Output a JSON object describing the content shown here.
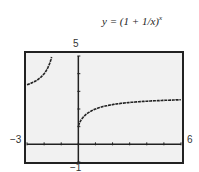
{
  "chart_data": {
    "type": "line",
    "xlabel": "",
    "ylabel": "",
    "xlim": [
      -3,
      6
    ],
    "ylim": [
      -1,
      5
    ],
    "window_labels": {
      "xmin": "−3",
      "xmax": "6",
      "ymin": "−1",
      "ymax": "5"
    },
    "x_tick_step": 1,
    "y_tick_step": 1,
    "grid": false,
    "series": [
      {
        "name": "left branch (x < -1)",
        "x": [
          -3,
          -2.5,
          -2,
          -1.5,
          -1.2,
          -1.1
        ],
        "values": [
          3.375,
          3.62,
          4.0,
          5.196,
          8.0,
          13.8
        ]
      },
      {
        "name": "right branch (x > 0)",
        "x": [
          0.05,
          0.25,
          0.5,
          1,
          2,
          3,
          4,
          5,
          6
        ],
        "values": [
          1.16,
          1.5,
          1.73,
          2.0,
          2.25,
          2.37,
          2.44,
          2.49,
          2.52
        ]
      }
    ]
  },
  "labels": {
    "title_text": "y = (1 + 1/x)",
    "title_exp": "x",
    "xmin": "−3",
    "xmax": "6",
    "ymin": "−1",
    "ymax": "5"
  }
}
